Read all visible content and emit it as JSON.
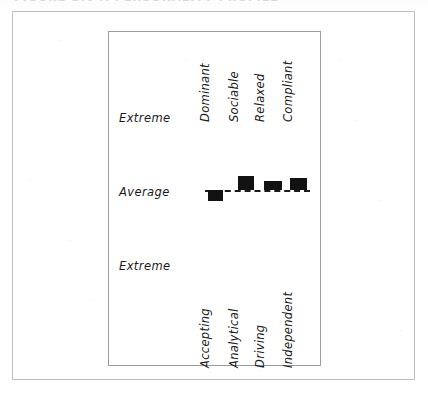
{
  "figure": {
    "scan_artifact_text": "FIGURE 3.6   A PERSONALITY PROFILE",
    "outer_frame_color": "#bfbfc2",
    "inner_frame_color": "#9c9c9f",
    "ink_color": "#121212",
    "background_color": "#ffffff"
  },
  "chart_data": {
    "type": "bar",
    "title": "",
    "subtitle": "",
    "xlabel": "",
    "ylabel": "",
    "orientation": "vertical",
    "baseline_label": "Average",
    "grid": false,
    "legend": false,
    "legend_position": "none",
    "axis_style": "diverging-around-average",
    "ylim": [
      -1,
      1
    ],
    "ytick_labels": [
      "Extreme",
      "Average",
      "Extreme"
    ],
    "ytick_values": [
      1,
      0,
      -1
    ],
    "top_pole_labels": [
      "Dominant",
      "Sociable",
      "Relaxed",
      "Compliant"
    ],
    "bottom_pole_labels": [
      "Accepting",
      "Analytical",
      "Driving",
      "Independent"
    ],
    "categories": [
      "Dominant / Accepting",
      "Sociable / Analytical",
      "Relaxed / Driving",
      "Compliant / Independent"
    ],
    "values": [
      -0.09,
      0.11,
      0.07,
      0.09
    ],
    "bars": [
      {
        "index": 0,
        "top_pole": "Dominant",
        "bottom_pole": "Accepting",
        "value": -0.09,
        "direction": "below",
        "left_px": 100,
        "width_px": 15,
        "height_px": 11
      },
      {
        "index": 1,
        "top_pole": "Sociable",
        "bottom_pole": "Analytical",
        "value": 0.11,
        "direction": "above",
        "left_px": 130,
        "width_px": 16,
        "height_px": 14
      },
      {
        "index": 2,
        "top_pole": "Relaxed",
        "bottom_pole": "Driving",
        "value": 0.07,
        "direction": "above",
        "left_px": 156,
        "width_px": 18,
        "height_px": 9
      },
      {
        "index": 3,
        "top_pole": "Compliant",
        "bottom_pole": "Independent",
        "value": 0.09,
        "direction": "above",
        "left_px": 182,
        "width_px": 17,
        "height_px": 12
      }
    ],
    "top_label_x_px": [
      104,
      133,
      159,
      187
    ],
    "bottom_label_x_px": [
      104,
      133,
      159,
      187
    ]
  }
}
